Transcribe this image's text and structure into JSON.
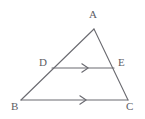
{
  "figure": {
    "kind": "geometry-diagram",
    "shape_name": "triangle",
    "background_color": "#ffffff",
    "stroke_color": "#6a6a70",
    "label_color": "#5d5d64",
    "stroke_width": 1.1,
    "points": {
      "A": {
        "label": "A",
        "x": 94,
        "y": 29
      },
      "B": {
        "label": "B",
        "x": 21,
        "y": 100
      },
      "C": {
        "label": "C",
        "x": 128,
        "y": 100
      },
      "D": {
        "label": "D",
        "x": 52,
        "y": 68
      },
      "E": {
        "label": "E",
        "x": 114,
        "y": 68
      }
    },
    "labels": {
      "A": {
        "text": "A",
        "x": 89,
        "y": 9
      },
      "B": {
        "text": "B",
        "x": 11,
        "y": 101
      },
      "C": {
        "text": "C",
        "x": 126,
        "y": 101
      },
      "D": {
        "text": "D",
        "x": 39,
        "y": 57
      },
      "E": {
        "text": "E",
        "x": 118,
        "y": 57
      }
    },
    "segments": [
      {
        "name": "AB",
        "from": "A",
        "to": "B"
      },
      {
        "name": "AC",
        "from": "A",
        "to": "C"
      },
      {
        "name": "BC",
        "from": "B",
        "to": "C"
      },
      {
        "name": "DE",
        "from": "D",
        "to": "E"
      }
    ],
    "parallel_marks": [
      {
        "name": "mark-on-DE",
        "segment": "DE",
        "ticks": 1,
        "x": 85,
        "y": 68
      },
      {
        "name": "mark-on-BC",
        "segment": "BC",
        "ticks": 1,
        "x": 83,
        "y": 100
      }
    ]
  }
}
